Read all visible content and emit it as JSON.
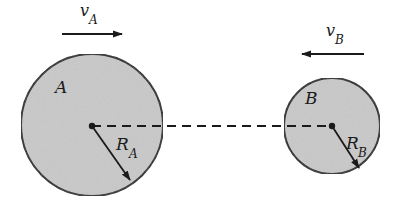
{
  "diagram": {
    "title": "",
    "colors": {
      "disk_fill": "#c9c9c9",
      "stroke": "#1a1a1a",
      "background": "#ffffff"
    },
    "disk_a": {
      "label": "A",
      "radius_label": "R",
      "radius_subscript": "A",
      "velocity_label": "v",
      "velocity_subscript": "A",
      "velocity_direction": "right"
    },
    "disk_b": {
      "label": "B",
      "radius_label": "R",
      "radius_subscript": "B",
      "velocity_label": "v",
      "velocity_subscript": "B",
      "velocity_direction": "left"
    },
    "center_line": "dashed"
  }
}
